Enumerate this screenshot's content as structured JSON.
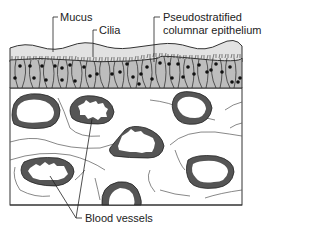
{
  "diagram": {
    "type": "histology-cross-section",
    "labels": {
      "mucus": "Mucus",
      "cilia": "Cilia",
      "epithelium_line1": "Pseudostratified",
      "epithelium_line2": "columnar epithelium",
      "blood_vessels": "Blood vessels"
    },
    "colors": {
      "mucus": "#e2e2e2",
      "epithelium": "#bdbdbd",
      "nucleus": "#111111",
      "vessel_wall": "#555555",
      "connective_tissue": "#ffffff",
      "outline": "#333333"
    }
  }
}
